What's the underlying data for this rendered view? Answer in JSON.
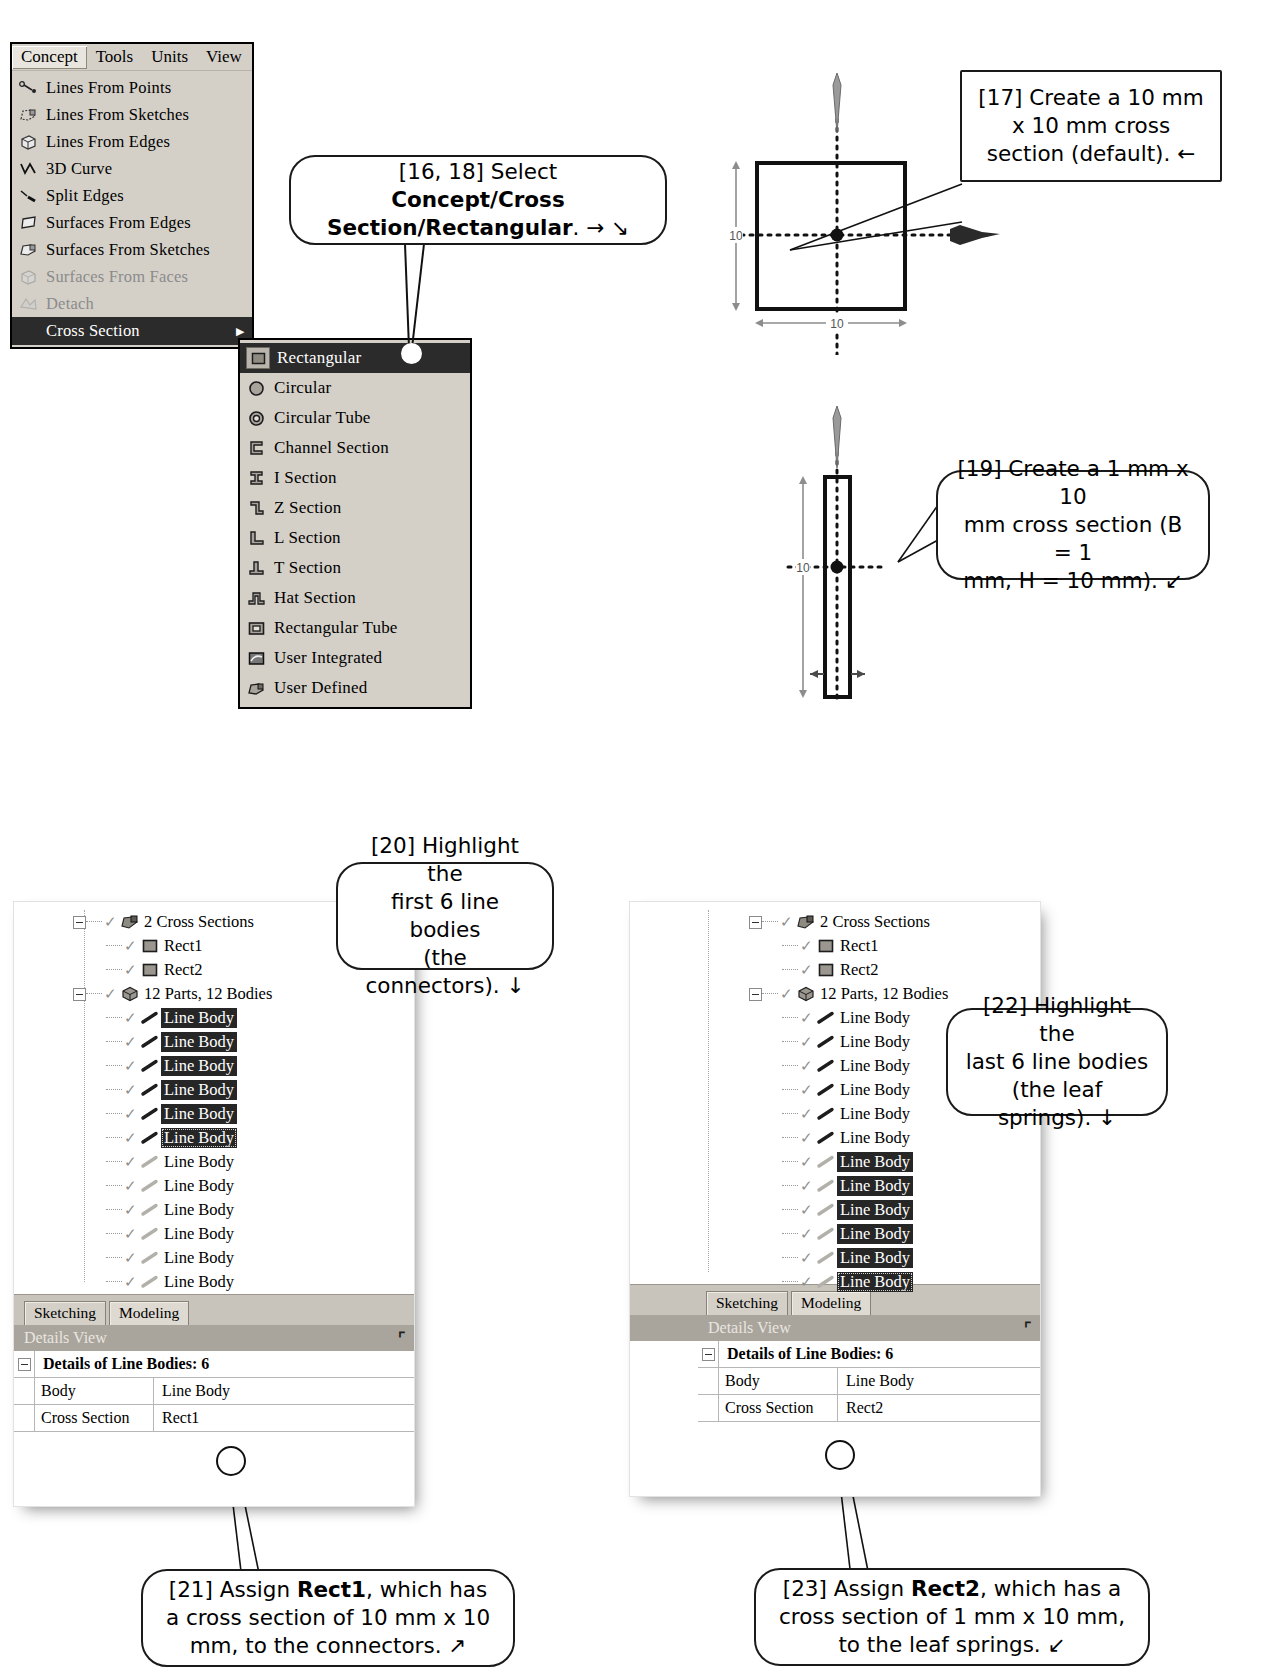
{
  "menu": {
    "menubar_items": [
      {
        "label": "Concept",
        "active": true
      },
      {
        "label": "Tools",
        "active": false
      },
      {
        "label": "Units",
        "active": false
      },
      {
        "label": "View",
        "active": false
      }
    ],
    "items": [
      {
        "label": "Lines From Points",
        "icon": "lines-from-points-icon",
        "state": "normal"
      },
      {
        "label": "Lines From Sketches",
        "icon": "lines-from-sketches-icon",
        "state": "normal"
      },
      {
        "label": "Lines From Edges",
        "icon": "lines-from-edges-icon",
        "state": "normal"
      },
      {
        "label": "3D Curve",
        "icon": "3d-curve-icon",
        "state": "normal"
      },
      {
        "label": "Split Edges",
        "icon": "split-edges-icon",
        "state": "normal"
      },
      {
        "label": "Surfaces From Edges",
        "icon": "surfaces-from-edges-icon",
        "state": "normal"
      },
      {
        "label": "Surfaces From Sketches",
        "icon": "surfaces-from-sketches-icon",
        "state": "normal"
      },
      {
        "label": "Surfaces From Faces",
        "icon": "surfaces-from-faces-icon",
        "state": "disabled"
      },
      {
        "label": "Detach",
        "icon": "detach-icon",
        "state": "disabled"
      },
      {
        "label": "Cross Section",
        "icon": "cross-section-icon",
        "state": "selected",
        "has_submenu": true
      }
    ],
    "submenu_items": [
      {
        "label": "Rectangular",
        "icon": "rectangular-section-icon",
        "selected": true
      },
      {
        "label": "Circular",
        "icon": "circular-section-icon",
        "selected": false
      },
      {
        "label": "Circular Tube",
        "icon": "circular-tube-icon",
        "selected": false
      },
      {
        "label": "Channel Section",
        "icon": "channel-section-icon",
        "selected": false
      },
      {
        "label": "I Section",
        "icon": "i-section-icon",
        "selected": false
      },
      {
        "label": "Z Section",
        "icon": "z-section-icon",
        "selected": false
      },
      {
        "label": "L Section",
        "icon": "l-section-icon",
        "selected": false
      },
      {
        "label": "T Section",
        "icon": "t-section-icon",
        "selected": false
      },
      {
        "label": "Hat Section",
        "icon": "hat-section-icon",
        "selected": false
      },
      {
        "label": "Rectangular Tube",
        "icon": "rectangular-tube-icon",
        "selected": false
      },
      {
        "label": "User Integrated",
        "icon": "user-integrated-icon",
        "selected": false
      },
      {
        "label": "User Defined",
        "icon": "user-defined-icon",
        "selected": false
      }
    ]
  },
  "callouts": {
    "c16_18": {
      "id": "[16, 18]",
      "text_plain_1": "[16, 18] Select ",
      "text_bold": "Concept/Cross Section/Rectangular",
      "text_plain_2": ". → ↘"
    },
    "c17": {
      "line1": "[17] Create a 10 mm",
      "line2": "x 10 mm cross",
      "line3": "section (default). ←"
    },
    "c19": {
      "line1": "[19] Create a 1 mm x 10",
      "line2": "mm cross section (B = 1",
      "line3": "mm, H = 10 mm). ↙"
    },
    "c20": {
      "line1": "[20] Highlight the",
      "line2": "first 6 line bodies",
      "line3": "(the connectors). ↓"
    },
    "c21": {
      "pre": "[21] Assign ",
      "bold": "Rect1",
      "post": ", which has a cross section of 10 mm x 10 mm, to the connectors. ↗"
    },
    "c22": {
      "line1": "[22] Highlight the",
      "line2": "last 6 line bodies",
      "line3": "(the leaf springs). ↓"
    },
    "c23": {
      "pre": "[23] Assign ",
      "bold": "Rect2",
      "post": ", which has a cross section of 1 mm x 10 mm, to the leaf springs. ↙"
    }
  },
  "sketch_top": {
    "name": "rectangular-10x10-sketch",
    "height_dim": "10",
    "width_dim": "10"
  },
  "sketch_bottom": {
    "name": "rectangular-1x10-sketch",
    "height_dim": "10",
    "width_dim": "1"
  },
  "tree_left": {
    "nodes": [
      {
        "label": "2 Cross Sections",
        "icon": "cross-sections-folder-icon",
        "depth": 0,
        "expander": true,
        "check": true,
        "highlight": false
      },
      {
        "label": "Rect1",
        "icon": "rect-section-icon",
        "depth": 1,
        "expander": false,
        "check": true,
        "highlight": false
      },
      {
        "label": "Rect2",
        "icon": "rect-section-icon",
        "depth": 1,
        "expander": false,
        "check": true,
        "highlight": false
      },
      {
        "label": "12 Parts, 12 Bodies",
        "icon": "parts-bodies-icon",
        "depth": 0,
        "expander": true,
        "check": true,
        "highlight": false
      },
      {
        "label": "Line Body",
        "icon": "line-body-dark-icon",
        "depth": 1,
        "expander": false,
        "check": true,
        "highlight": true
      },
      {
        "label": "Line Body",
        "icon": "line-body-dark-icon",
        "depth": 1,
        "expander": false,
        "check": true,
        "highlight": true
      },
      {
        "label": "Line Body",
        "icon": "line-body-dark-icon",
        "depth": 1,
        "expander": false,
        "check": true,
        "highlight": true
      },
      {
        "label": "Line Body",
        "icon": "line-body-dark-icon",
        "depth": 1,
        "expander": false,
        "check": true,
        "highlight": true
      },
      {
        "label": "Line Body",
        "icon": "line-body-dark-icon",
        "depth": 1,
        "expander": false,
        "check": true,
        "highlight": true
      },
      {
        "label": "Line Body",
        "icon": "line-body-dark-icon",
        "depth": 1,
        "expander": false,
        "check": true,
        "highlight": true,
        "focus": true
      },
      {
        "label": "Line Body",
        "icon": "line-body-light-icon",
        "depth": 1,
        "expander": false,
        "check": true,
        "highlight": false
      },
      {
        "label": "Line Body",
        "icon": "line-body-light-icon",
        "depth": 1,
        "expander": false,
        "check": true,
        "highlight": false
      },
      {
        "label": "Line Body",
        "icon": "line-body-light-icon",
        "depth": 1,
        "expander": false,
        "check": true,
        "highlight": false
      },
      {
        "label": "Line Body",
        "icon": "line-body-light-icon",
        "depth": 1,
        "expander": false,
        "check": true,
        "highlight": false
      },
      {
        "label": "Line Body",
        "icon": "line-body-light-icon",
        "depth": 1,
        "expander": false,
        "check": true,
        "highlight": false
      },
      {
        "label": "Line Body",
        "icon": "line-body-light-icon",
        "depth": 1,
        "expander": false,
        "check": true,
        "highlight": false
      }
    ],
    "tabs": [
      {
        "label": "Sketching",
        "selected": false
      },
      {
        "label": "Modeling",
        "selected": true
      }
    ],
    "details_title": "Details View",
    "details_pin": "pin-icon",
    "details": {
      "group_title": "Details of Line Bodies: 6",
      "rows": [
        {
          "name": "Body",
          "value": "Line Body"
        },
        {
          "name": "Cross Section",
          "value": "Rect1"
        }
      ]
    }
  },
  "tree_right": {
    "nodes": [
      {
        "label": "2 Cross Sections",
        "icon": "cross-sections-folder-icon",
        "depth": 0,
        "expander": true,
        "check": true,
        "highlight": false
      },
      {
        "label": "Rect1",
        "icon": "rect-section-icon",
        "depth": 1,
        "expander": false,
        "check": true,
        "highlight": false
      },
      {
        "label": "Rect2",
        "icon": "rect-section-icon",
        "depth": 1,
        "expander": false,
        "check": true,
        "highlight": false
      },
      {
        "label": "12 Parts, 12 Bodies",
        "icon": "parts-bodies-icon",
        "depth": 0,
        "expander": true,
        "check": true,
        "highlight": false
      },
      {
        "label": "Line Body",
        "icon": "line-body-dark-icon",
        "depth": 1,
        "expander": false,
        "check": true,
        "highlight": false
      },
      {
        "label": "Line Body",
        "icon": "line-body-dark-icon",
        "depth": 1,
        "expander": false,
        "check": true,
        "highlight": false
      },
      {
        "label": "Line Body",
        "icon": "line-body-dark-icon",
        "depth": 1,
        "expander": false,
        "check": true,
        "highlight": false
      },
      {
        "label": "Line Body",
        "icon": "line-body-dark-icon",
        "depth": 1,
        "expander": false,
        "check": true,
        "highlight": false
      },
      {
        "label": "Line Body",
        "icon": "line-body-dark-icon",
        "depth": 1,
        "expander": false,
        "check": true,
        "highlight": false
      },
      {
        "label": "Line Body",
        "icon": "line-body-dark-icon",
        "depth": 1,
        "expander": false,
        "check": true,
        "highlight": false
      },
      {
        "label": "Line Body",
        "icon": "line-body-light-icon",
        "depth": 1,
        "expander": false,
        "check": true,
        "highlight": true
      },
      {
        "label": "Line Body",
        "icon": "line-body-light-icon",
        "depth": 1,
        "expander": false,
        "check": true,
        "highlight": true
      },
      {
        "label": "Line Body",
        "icon": "line-body-light-icon",
        "depth": 1,
        "expander": false,
        "check": true,
        "highlight": true
      },
      {
        "label": "Line Body",
        "icon": "line-body-light-icon",
        "depth": 1,
        "expander": false,
        "check": true,
        "highlight": true
      },
      {
        "label": "Line Body",
        "icon": "line-body-light-icon",
        "depth": 1,
        "expander": false,
        "check": true,
        "highlight": true
      },
      {
        "label": "Line Body",
        "icon": "line-body-light-icon",
        "depth": 1,
        "expander": false,
        "check": true,
        "highlight": true,
        "focus": true
      }
    ],
    "tabs": [
      {
        "label": "Sketching",
        "selected": false
      },
      {
        "label": "Modeling",
        "selected": true
      }
    ],
    "details_title": "Details View",
    "details_pin": "pin-icon",
    "details": {
      "group_title": "Details of Line Bodies: 6",
      "rows": [
        {
          "name": "Body",
          "value": "Line Body"
        },
        {
          "name": "Cross Section",
          "value": "Rect2"
        }
      ]
    }
  }
}
